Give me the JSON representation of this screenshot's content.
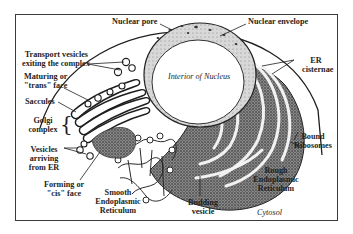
{
  "figure": {
    "labels": {
      "nuclear_pore": "Nuclear pore",
      "nuclear_envelope": "Nuclear envelope",
      "transport_vesicles": [
        "Transport vesicles",
        "exiting the complex"
      ],
      "maturing_face": [
        "Maturing or",
        "\"trans\" face"
      ],
      "saccules": "Saccules",
      "golgi_complex": [
        "Golgi",
        "complex"
      ],
      "golgi_brace": "{",
      "vesicles_arriving": [
        "Vesicles",
        "arriving",
        "from ER"
      ],
      "forming_face": [
        "Forming or",
        "\"cis\" face"
      ],
      "smooth_er": [
        "Smooth",
        "Endoplasmic",
        "Reticulum"
      ],
      "interior_nucleus": "Interior of Nucleus",
      "er_cisternae": [
        "ER",
        "cisternae"
      ],
      "bound_ribosomes": [
        "Bound",
        "Ribosomes"
      ],
      "rough_er": [
        "Rough",
        "Endoplasmic",
        "Reticulum"
      ],
      "budding_vesicle": [
        "Budding",
        "vesicle"
      ],
      "cytosol": "Cytosol"
    },
    "colors": {
      "ink": "#1e1e1e",
      "frame": "#3a3a3a",
      "stipple": "#6b6b6b",
      "background": "#ffffff"
    }
  }
}
